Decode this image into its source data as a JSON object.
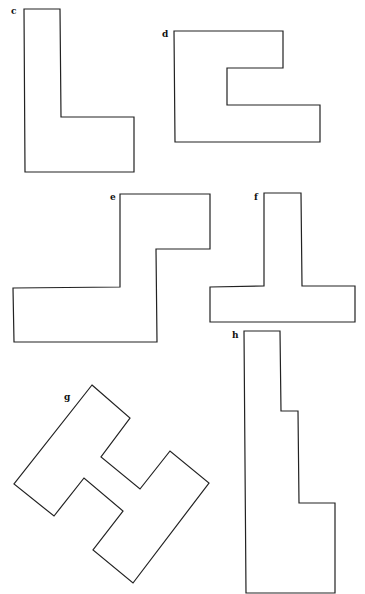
{
  "figure": {
    "width": 365,
    "height": 594,
    "stroke_color": "#222222",
    "background": "#ffffff",
    "shapes": [
      {
        "id": "c",
        "label": "c",
        "label_pos": [
          11,
          14
        ],
        "points": "24,9 60,9 61,117 134,117 134,172 25,172"
      },
      {
        "id": "d",
        "label": "d",
        "label_pos": [
          162,
          37
        ],
        "points": "174,31 283,31 283,68 227,68 227,105 320,105 320,142 175,142"
      },
      {
        "id": "e",
        "label": "e",
        "label_pos": [
          110,
          200
        ],
        "points": "120,194 210,194 210,249 156,249 157,342 14,342 13,288 120,287"
      },
      {
        "id": "f",
        "label": "f",
        "label_pos": [
          254,
          200
        ],
        "points": "264,193 301,193 302,286 355,286 355,322 210,322 210,287 264,286"
      },
      {
        "id": "g",
        "label": "g",
        "label_pos": [
          64,
          400
        ],
        "points": "92,385 130,418 101,457 140,489 170,451 209,483 133,583 93,550 123,511 84,478 54,516 14,484"
      },
      {
        "id": "h",
        "label": "h",
        "label_pos": [
          232,
          338
        ],
        "points": "244,331 280,331 281,411 298,411 299,503 335,503 335,593 246,593"
      }
    ]
  }
}
